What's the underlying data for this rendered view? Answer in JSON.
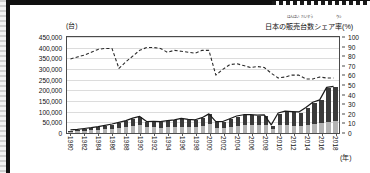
{
  "figure": {
    "y_unit_label": "(台)",
    "x_unit_label": "(年)",
    "right_axis_title": {
      "full": "日本の販売台数シェア率(%)",
      "seg1": "日本の",
      "seg2": "販売",
      "seg2_furigana": "はんばい",
      "seg3": "台数",
      "seg3_furigana": "だいすう",
      "seg4": "シェア",
      "seg5": "率",
      "seg5_furigana": "りつ",
      "seg6": "(%)"
    }
  },
  "chart_data": {
    "type": "bar",
    "title": "",
    "subtitle": "",
    "xlabel": "(年)",
    "ylabel": "(台)",
    "y2label": "日本の販売台数シェア率(%)",
    "grid": true,
    "legend_position": "none",
    "xlim": [
      1980,
      2018
    ],
    "ylim": [
      0,
      450000
    ],
    "y2lim": [
      0,
      100
    ],
    "y_ticks": [
      "0",
      "50,000",
      "100,000",
      "150,000",
      "200,000",
      "250,000",
      "300,000",
      "350,000",
      "400,000",
      "450,000"
    ],
    "y_tick_values": [
      0,
      50000,
      100000,
      150000,
      200000,
      250000,
      300000,
      350000,
      400000,
      450000
    ],
    "y2_ticks": [
      "0",
      "10",
      "20",
      "30",
      "40",
      "50",
      "60",
      "70",
      "80",
      "90",
      "100"
    ],
    "y2_tick_values": [
      0,
      10,
      20,
      30,
      40,
      50,
      60,
      70,
      80,
      90,
      100
    ],
    "x": [
      1980,
      1981,
      1982,
      1983,
      1984,
      1985,
      1986,
      1987,
      1988,
      1989,
      1990,
      1991,
      1992,
      1993,
      1994,
      1995,
      1996,
      1997,
      1998,
      1999,
      2000,
      2001,
      2002,
      2003,
      2004,
      2005,
      2006,
      2007,
      2008,
      2009,
      2010,
      2011,
      2012,
      2013,
      2014,
      2015,
      2016,
      2017,
      2018
    ],
    "x_tick_labels": [
      "1980",
      "1982",
      "1984",
      "1986",
      "1988",
      "1990",
      "1992",
      "1994",
      "1996",
      "1998",
      "2000",
      "2002",
      "2004",
      "2006",
      "2008",
      "2010",
      "2012",
      "2014",
      "2016",
      "2018"
    ],
    "x_tick_values": [
      1980,
      1982,
      1984,
      1986,
      1988,
      1990,
      1992,
      1994,
      1996,
      1998,
      2000,
      2002,
      2004,
      2006,
      2008,
      2010,
      2012,
      2014,
      2016,
      2018
    ],
    "series": [
      {
        "name": "bar-segment-lower",
        "type": "bar",
        "axis": "left",
        "color": "#b3b3b3",
        "stack": "total",
        "values": [
          6000,
          8000,
          10000,
          12000,
          14000,
          17000,
          20000,
          24000,
          27000,
          32000,
          38000,
          26000,
          26000,
          25000,
          26000,
          28000,
          30000,
          29000,
          28000,
          32000,
          42000,
          25000,
          25000,
          29000,
          34000,
          38000,
          38000,
          37000,
          38000,
          17000,
          36000,
          36000,
          35000,
          35000,
          36000,
          42000,
          46000,
          52000,
          55000
        ]
      },
      {
        "name": "bar-segment-upper",
        "type": "bar",
        "axis": "left",
        "color": "#3a3a3a",
        "stack": "total",
        "values": [
          5000,
          6000,
          8000,
          10000,
          13000,
          16000,
          19000,
          23000,
          28000,
          35000,
          37000,
          25000,
          26000,
          25000,
          29000,
          31000,
          36000,
          32000,
          31000,
          37000,
          45000,
          25000,
          26000,
          35000,
          43000,
          45000,
          45000,
          44000,
          44000,
          18000,
          55000,
          64000,
          63000,
          61000,
          81000,
          100000,
          107000,
          160000,
          162000
        ]
      },
      {
        "name": "total-units-line",
        "type": "line",
        "axis": "left",
        "style": "solid",
        "color": "#1a1a1a",
        "values": [
          11000,
          14000,
          18000,
          22000,
          27000,
          33000,
          39000,
          47000,
          55000,
          67000,
          75000,
          51000,
          52000,
          50000,
          55000,
          59000,
          66000,
          61000,
          59000,
          69000,
          87000,
          50000,
          51000,
          64000,
          77000,
          83000,
          83000,
          81000,
          82000,
          35000,
          91000,
          100000,
          98000,
          96000,
          117000,
          142000,
          153000,
          212000,
          217000
        ]
      },
      {
        "name": "japan-share-rate-line",
        "type": "line",
        "axis": "right",
        "style": "dashed",
        "color": "#2a2a2a",
        "unit": "%",
        "values": [
          77,
          79,
          81,
          84,
          87,
          88,
          88,
          67,
          74,
          80,
          86,
          89,
          89,
          88,
          84,
          86,
          85,
          84,
          83,
          86,
          86,
          60,
          66,
          71,
          72,
          70,
          68,
          69,
          68,
          62,
          57,
          58,
          60,
          60,
          56,
          56,
          58,
          57,
          57
        ]
      }
    ]
  }
}
